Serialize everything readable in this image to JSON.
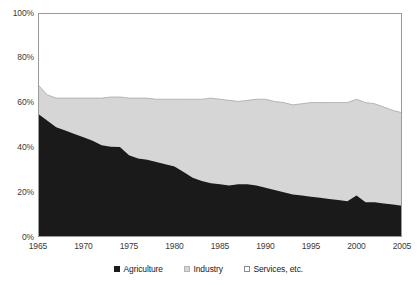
{
  "chart_data": {
    "type": "area",
    "stacked": true,
    "title": "",
    "subtitle": "",
    "xlabel": "",
    "ylabel": "",
    "xlim": [
      1965,
      2005
    ],
    "ylim": [
      0,
      100
    ],
    "grid": false,
    "legend_position": "bottom-center",
    "y_ticks": [
      0,
      20,
      40,
      60,
      80,
      100
    ],
    "y_tick_labels": [
      "0%",
      "20%",
      "40%",
      "60%",
      "80%",
      "100%"
    ],
    "x_ticks": [
      1965,
      1970,
      1975,
      1980,
      1985,
      1990,
      1995,
      2000,
      2005
    ],
    "x_tick_labels": [
      "1965",
      "1970",
      "1975",
      "1980",
      "1985",
      "1990",
      "1995",
      "2000",
      "2005"
    ],
    "x": [
      1965,
      1966,
      1967,
      1968,
      1969,
      1970,
      1971,
      1972,
      1973,
      1974,
      1975,
      1976,
      1977,
      1978,
      1979,
      1980,
      1981,
      1982,
      1983,
      1984,
      1985,
      1986,
      1987,
      1988,
      1989,
      1990,
      1991,
      1992,
      1993,
      1994,
      1995,
      1996,
      1997,
      1998,
      1999,
      2000,
      2001,
      2002,
      2003,
      2004,
      2005
    ],
    "series": [
      {
        "name": "Agriculture",
        "color": "#1a1a1a",
        "values": [
          55.0,
          52.0,
          49.0,
          47.5,
          46.0,
          44.5,
          43.0,
          41.0,
          40.3,
          40.2,
          36.5,
          35.0,
          34.5,
          33.5,
          32.5,
          31.5,
          29.0,
          26.5,
          25.0,
          24.0,
          23.5,
          23.0,
          23.5,
          23.5,
          23.0,
          22.0,
          21.0,
          20.0,
          19.0,
          18.5,
          18.0,
          17.5,
          17.0,
          16.5,
          16.0,
          18.5,
          15.5,
          15.5,
          15.0,
          14.5,
          14.0
        ]
      },
      {
        "name": "Industry",
        "color": "#d6d6d6",
        "values": [
          13.0,
          11.5,
          13.0,
          14.5,
          16.0,
          17.5,
          19.0,
          21.0,
          22.2,
          22.3,
          25.5,
          27.0,
          27.5,
          28.0,
          29.0,
          30.0,
          32.5,
          35.0,
          36.5,
          38.0,
          38.0,
          38.0,
          37.0,
          37.5,
          38.5,
          39.5,
          39.5,
          40.0,
          40.0,
          41.0,
          42.0,
          42.5,
          43.0,
          43.5,
          44.0,
          43.0,
          44.5,
          44.0,
          43.0,
          42.0,
          41.5
        ]
      },
      {
        "name": "Services, etc.",
        "color": "#ffffff",
        "values": [
          32.0,
          36.5,
          38.0,
          38.0,
          38.0,
          38.0,
          38.0,
          38.0,
          37.5,
          37.5,
          38.0,
          38.0,
          38.0,
          38.5,
          38.5,
          38.5,
          38.5,
          38.5,
          38.5,
          38.0,
          38.5,
          39.0,
          39.5,
          39.0,
          38.5,
          38.5,
          39.5,
          40.0,
          41.0,
          40.5,
          40.0,
          40.0,
          40.0,
          40.0,
          40.0,
          38.5,
          40.0,
          40.5,
          42.0,
          43.5,
          44.5
        ]
      }
    ],
    "cumulative_upper_boundary": [
      68.0,
      63.5,
      62.0,
      62.0,
      62.0,
      62.0,
      62.0,
      62.0,
      62.5,
      62.5,
      62.0,
      62.0,
      62.0,
      61.5,
      61.5,
      61.5,
      61.5,
      61.5,
      61.5,
      62.0,
      61.5,
      61.0,
      60.5,
      61.0,
      61.5,
      61.5,
      60.5,
      60.0,
      59.0,
      59.5,
      60.0,
      60.0,
      60.0,
      60.0,
      60.0,
      61.5,
      60.0,
      59.5,
      58.0,
      56.5,
      55.5
    ]
  },
  "axes": {
    "y_labels": [
      "100%",
      "80%",
      "60%",
      "40%",
      "20%",
      "0%"
    ],
    "x_labels": [
      "1965",
      "1970",
      "1975",
      "1980",
      "1985",
      "1990",
      "1995",
      "2000",
      "2005"
    ]
  },
  "legend": {
    "items": [
      {
        "label": "Agriculture",
        "color": "#1a1a1a",
        "border": "#1a1a1a"
      },
      {
        "label": "Industry",
        "color": "#d6d6d6",
        "border": "#b4b4b4"
      },
      {
        "label": "Services, etc.",
        "color": "#ffffff",
        "border": "#8c8c8c"
      }
    ]
  },
  "colors": {
    "agriculture": "#1a1a1a",
    "industry": "#d6d6d6",
    "services": "#ffffff",
    "frame": "#9a9a9a",
    "text": "#3a3a3a"
  }
}
